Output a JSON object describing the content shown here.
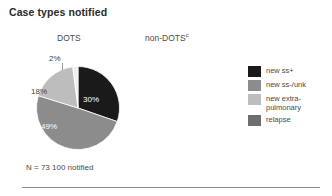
{
  "figure": {
    "title": "Case types notified",
    "columns": [
      {
        "label": "DOTS",
        "superscript": ""
      },
      {
        "label": "non-DOTS",
        "superscript": "c"
      }
    ],
    "caption": "N = 73 100 notified"
  },
  "legend": {
    "position": "right",
    "items": [
      {
        "label": "new ss+",
        "color": "#1a1a1a"
      },
      {
        "label": "new ss-/unk",
        "color": "#8c8c8c"
      },
      {
        "label": "new extra-\npulmonary",
        "color": "#bdbdbd"
      },
      {
        "label": "relapse",
        "color": "#6e6e6e"
      }
    ]
  },
  "chart_data": {
    "type": "pie",
    "title": "Case types notified",
    "subtitle": "DOTS",
    "caption": "N = 73 100 notified",
    "total_label": "N = 73 100 notified",
    "total_value": 73100,
    "unit": "percent",
    "start_angle": 0,
    "direction": "clockwise",
    "labels": [
      "new ss+",
      "new ss-/unk",
      "new extra-pulmonary",
      "relapse"
    ],
    "values": [
      30,
      49,
      18,
      2
    ],
    "value_labels": [
      "30%",
      "49%",
      "18%",
      "2%"
    ],
    "colors": [
      "#1a1a1a",
      "#8c8c8c",
      "#bdbdbd",
      "#efefef"
    ],
    "legend_colors": [
      "#1a1a1a",
      "#8c8c8c",
      "#bdbdbd",
      "#6e6e6e"
    ],
    "slices": [
      {
        "name": "new ss+",
        "value": 30,
        "label": "30%",
        "color": "#1a1a1a",
        "label_color": "#ffffff"
      },
      {
        "name": "new ss-/unk",
        "value": 49,
        "label": "49%",
        "color": "#8c8c8c",
        "label_color": "#ffffff"
      },
      {
        "name": "new extra-pulmonary",
        "value": 18,
        "label": "18%",
        "color": "#bdbdbd",
        "label_color": "#404040"
      },
      {
        "name": "relapse",
        "value": 2,
        "label": "2%",
        "color": "#efefef",
        "label_color": "#404040"
      }
    ],
    "legend_position": "right",
    "grid": false
  },
  "pie_labels": {
    "p2": "2%",
    "p18": "18%",
    "p49": "49%",
    "p30": "30%"
  }
}
